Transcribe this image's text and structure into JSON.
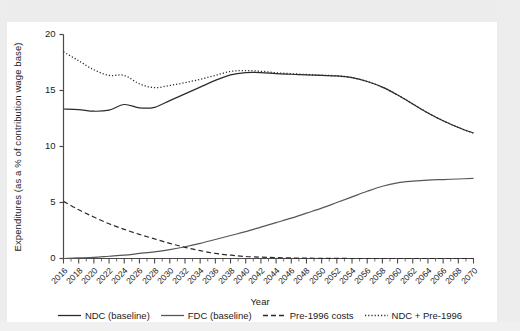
{
  "chart_data": {
    "type": "line",
    "title": "",
    "xlabel": "Year",
    "ylabel": "Expenditures (as a % of contribution wage base)",
    "xlim": [
      2016,
      2070
    ],
    "ylim": [
      0,
      20
    ],
    "yticks": [
      0,
      5,
      10,
      15,
      20
    ],
    "grid": false,
    "legend_position": "bottom",
    "categories": [
      2016,
      2018,
      2020,
      2022,
      2024,
      2026,
      2028,
      2030,
      2032,
      2034,
      2036,
      2038,
      2040,
      2042,
      2044,
      2046,
      2048,
      2050,
      2052,
      2054,
      2056,
      2058,
      2060,
      2062,
      2064,
      2066,
      2068,
      2070
    ],
    "xtick_labels": [
      "2016",
      "2018",
      "2020",
      "2022",
      "2024",
      "2026",
      "2028",
      "2030",
      "2032",
      "2034",
      "2036",
      "2038",
      "2040",
      "2042",
      "2044",
      "2046",
      "2048",
      "2050",
      "2052",
      "2054",
      "2056",
      "2058",
      "2060",
      "2062",
      "2064",
      "2066",
      "2068",
      "2070"
    ],
    "series": [
      {
        "name": "NDC (baseline)",
        "style": "solid",
        "color": "#2b2b2b",
        "values": [
          13.35,
          13.3,
          13.15,
          13.25,
          13.75,
          13.45,
          13.5,
          14.1,
          14.7,
          15.3,
          15.9,
          16.4,
          16.6,
          16.6,
          16.5,
          16.45,
          16.4,
          16.35,
          16.3,
          16.15,
          15.8,
          15.3,
          14.6,
          13.8,
          13.0,
          12.3,
          11.7,
          11.2
        ]
      },
      {
        "name": "FDC (baseline)",
        "style": "solid",
        "color": "#575757",
        "values": [
          0.0,
          0.05,
          0.1,
          0.2,
          0.3,
          0.45,
          0.6,
          0.8,
          1.05,
          1.35,
          1.7,
          2.05,
          2.4,
          2.8,
          3.2,
          3.6,
          4.05,
          4.5,
          5.0,
          5.5,
          6.0,
          6.45,
          6.75,
          6.9,
          7.0,
          7.05,
          7.1,
          7.15
        ]
      },
      {
        "name": "Pre-1996 costs",
        "style": "dashed",
        "color": "#2b2b2b",
        "values": [
          5.1,
          4.35,
          3.7,
          3.1,
          2.6,
          2.15,
          1.75,
          1.35,
          1.0,
          0.7,
          0.45,
          0.3,
          0.18,
          0.12,
          0.08,
          0.05,
          0.03,
          0.02,
          0.01,
          0.0,
          0.0,
          0.0,
          0.0,
          0.0,
          0.0,
          0.0,
          0.0,
          0.0
        ]
      },
      {
        "name": "NDC + Pre-1996",
        "style": "dotted",
        "color": "#2b2b2b",
        "values": [
          18.45,
          17.65,
          16.85,
          16.35,
          16.35,
          15.6,
          15.25,
          15.45,
          15.7,
          16.0,
          16.35,
          16.7,
          16.78,
          16.72,
          16.58,
          16.5,
          16.43,
          16.37,
          16.31,
          16.15,
          15.8,
          15.3,
          14.6,
          13.8,
          13.0,
          12.3,
          11.7,
          11.2
        ]
      }
    ]
  },
  "legend": {
    "items": [
      {
        "label": "NDC (baseline)",
        "style": "solid",
        "color": "#2b2b2b"
      },
      {
        "label": "FDC (baseline)",
        "style": "solid",
        "color": "#575757"
      },
      {
        "label": "Pre-1996 costs",
        "style": "dashed",
        "color": "#2b2b2b"
      },
      {
        "label": "NDC + Pre-1996",
        "style": "dotted",
        "color": "#2b2b2b"
      }
    ]
  },
  "axes": {
    "x_title": "Year",
    "y_title": "Expenditures (as a % of contribution wage base)"
  },
  "colors": {
    "axis": "#4a4a4a",
    "text": "#1b1b1b",
    "background": "#ffffff",
    "scan_band": "#ececed"
  }
}
